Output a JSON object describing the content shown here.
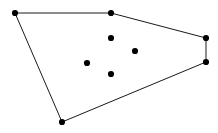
{
  "figure": {
    "title": "",
    "background_color": "#ffffff",
    "width": 218,
    "height": 133
  },
  "chart_data": {
    "type": "scatter",
    "title": "",
    "xlabel": "",
    "ylabel": "",
    "xlim": [
      0,
      218
    ],
    "ylim": [
      0,
      133
    ],
    "grid": false,
    "legend": false,
    "axes_visible": false,
    "series": [
      {
        "name": "hull-vertices",
        "marker": "filled-circle",
        "marker_color": "#000000",
        "marker_size": 6,
        "points": [
          {
            "label": "A",
            "x": 15,
            "y": 13
          },
          {
            "label": "B",
            "x": 111,
            "y": 13
          },
          {
            "label": "C",
            "x": 206,
            "y": 38
          },
          {
            "label": "D",
            "x": 206,
            "y": 62
          },
          {
            "label": "E",
            "x": 62,
            "y": 122
          }
        ]
      },
      {
        "name": "interior-points",
        "marker": "filled-circle",
        "marker_color": "#000000",
        "marker_size": 6,
        "points": [
          {
            "label": "F",
            "x": 111,
            "y": 38
          },
          {
            "label": "G",
            "x": 135,
            "y": 51
          },
          {
            "label": "H",
            "x": 87,
            "y": 63
          },
          {
            "label": "I",
            "x": 111,
            "y": 74
          }
        ]
      }
    ],
    "polygon": {
      "name": "convex-hull",
      "closed": true,
      "stroke_color": "#1a1a1a",
      "stroke_width": 1,
      "fill": "none",
      "vertex_order": [
        "A",
        "B",
        "C",
        "D",
        "E"
      ],
      "points_attr": "15,13 111,13 206,38 206,62 62,122",
      "edges": [
        {
          "from": "A",
          "to": "B"
        },
        {
          "from": "B",
          "to": "C"
        },
        {
          "from": "C",
          "to": "D"
        },
        {
          "from": "D",
          "to": "E"
        },
        {
          "from": "E",
          "to": "A"
        }
      ]
    }
  }
}
